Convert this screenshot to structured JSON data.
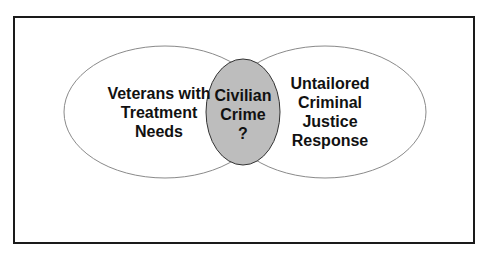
{
  "diagram": {
    "type": "venn",
    "left_circle": {
      "lines": [
        "Veterans with",
        "Treatment",
        "Needs"
      ],
      "fill": "#ffffff"
    },
    "right_circle": {
      "lines": [
        "Untailored",
        "Criminal",
        "Justice",
        "Response"
      ],
      "fill": "#ffffff"
    },
    "intersection": {
      "lines": [
        "Civilian",
        "Crime",
        "?"
      ],
      "fill": "#bdbdbd"
    }
  }
}
